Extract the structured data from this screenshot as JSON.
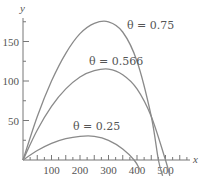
{
  "chart_data": {
    "type": "line",
    "title": "",
    "xlabel": "x",
    "ylabel": "y",
    "xlim": [
      0,
      600
    ],
    "ylim": [
      -15,
      190
    ],
    "grid": false,
    "x_ticks": [
      100,
      200,
      300,
      400,
      500
    ],
    "y_ticks": [
      50,
      100,
      150
    ],
    "series": [
      {
        "name": "θ = 0.75",
        "label": "θ = 0.75",
        "x": [
          0,
          50,
          100,
          150,
          200,
          250,
          300,
          350,
          400,
          450,
          475,
          490
        ],
        "y": [
          0,
          55,
          100,
          135,
          160,
          173,
          175,
          162,
          125,
          55,
          0,
          -20
        ]
      },
      {
        "name": "θ = 0.566",
        "label": "θ = 0.566",
        "x": [
          0,
          50,
          100,
          150,
          200,
          250,
          300,
          350,
          400,
          450,
          500,
          515
        ],
        "y": [
          0,
          38,
          68,
          90,
          105,
          113,
          115,
          108,
          90,
          55,
          0,
          -20
        ]
      },
      {
        "name": "θ = 0.25",
        "label": "θ = 0.25",
        "x": [
          0,
          50,
          100,
          150,
          200,
          250,
          300,
          350,
          390,
          410
        ],
        "y": [
          0,
          12,
          21,
          27,
          30,
          30,
          25,
          14,
          0,
          -12
        ]
      }
    ]
  },
  "axes": {
    "x_label": "x",
    "y_label": "y",
    "x_tick_labels": [
      "100",
      "200",
      "300",
      "400",
      "500"
    ],
    "y_tick_labels": [
      "50",
      "100",
      "150"
    ]
  },
  "annotations": {
    "theta_075": "θ = 0.75",
    "theta_0566": "θ = 0.566",
    "theta_025": "θ = 0.25"
  }
}
